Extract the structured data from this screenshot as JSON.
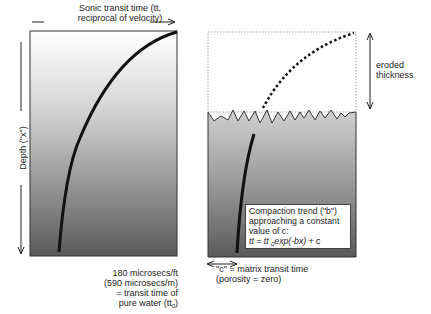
{
  "left_panel": {
    "x_axis_label": "Sonic transit time (tt, reciprocal of velocity)",
    "x_axis_label_line1": "Sonic transit time (tt,",
    "x_axis_label_line2": "reciprocal of velocity)",
    "y_axis_label": "Depth (\"x\")",
    "water_note": [
      "180 microsecs/ft",
      "(590 microsecs/m)",
      "= transit time of",
      "pure water (tt"
    ],
    "water_note_subscript": "0",
    "water_note_close": ")"
  },
  "right_panel": {
    "eroded_label": [
      "eroded",
      "thickness"
    ],
    "compaction_box": {
      "lines": [
        "Compaction trend (\"b\")",
        "approaching a constant",
        "value of c:"
      ],
      "equation_prefix": "tt = tt ",
      "equation_subscript": "0",
      "equation_suffix": "exp(-bx) + c"
    },
    "matrix_note": [
      "\"c\" = matrix transit time",
      "(porosity = zero)"
    ]
  },
  "colors": {
    "curve": "#111111",
    "gradient_top": "#ffffff",
    "gradient_bottom": "#5a5a5a"
  }
}
